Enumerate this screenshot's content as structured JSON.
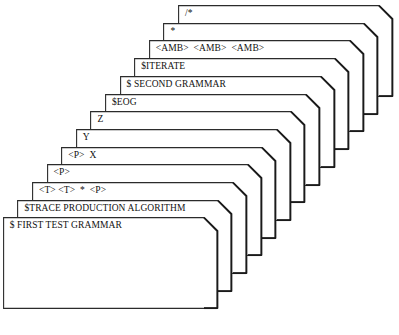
{
  "diagram": {
    "card_count": 13,
    "colors": {
      "card_fill": "#ffffff",
      "card_outline": "#2b2b2b",
      "card_shadow": "#1a1a1a",
      "text": "#111111",
      "background": "#ffffff",
      "watermark": "#d9d2cc"
    },
    "geometry": {
      "card_width": 215,
      "card_height": 92,
      "chamfer": 14,
      "step_x": -14.6,
      "step_y": 17.7,
      "top_card_left": 178,
      "top_card_top": 5,
      "bottom_card_width": 215,
      "bottom_card_height": 92
    },
    "watermark_text": ""
  },
  "cards": [
    {
      "index": 1,
      "label": "/*",
      "name": "card-comment-open"
    },
    {
      "index": 2,
      "label": "*",
      "name": "card-comment-star"
    },
    {
      "index": 3,
      "label": "<AMB>  <AMB>  <AMB>",
      "name": "card-amb-triple"
    },
    {
      "index": 4,
      "label": "$ITERATE",
      "name": "card-iterate"
    },
    {
      "index": 5,
      "label": "$ SECOND GRAMMAR",
      "name": "card-second-grammar"
    },
    {
      "index": 6,
      "label": "$EOG",
      "name": "card-eog"
    },
    {
      "index": 7,
      "label": "Z",
      "name": "card-z"
    },
    {
      "index": 8,
      "label": "Y",
      "name": "card-y"
    },
    {
      "index": 9,
      "label": "<P>  X",
      "name": "card-p-x"
    },
    {
      "index": 10,
      "label": "<P>",
      "name": "card-p"
    },
    {
      "index": 11,
      "label": "<T> <T>  *  <P>",
      "name": "card-t-t-p"
    },
    {
      "index": 12,
      "label": "$TRACE PRODUCTION ALGORITHM",
      "name": "card-trace-production-algorithm"
    },
    {
      "index": 13,
      "label": "$ FIRST TEST GRAMMAR",
      "name": "card-first-test-grammar"
    }
  ]
}
